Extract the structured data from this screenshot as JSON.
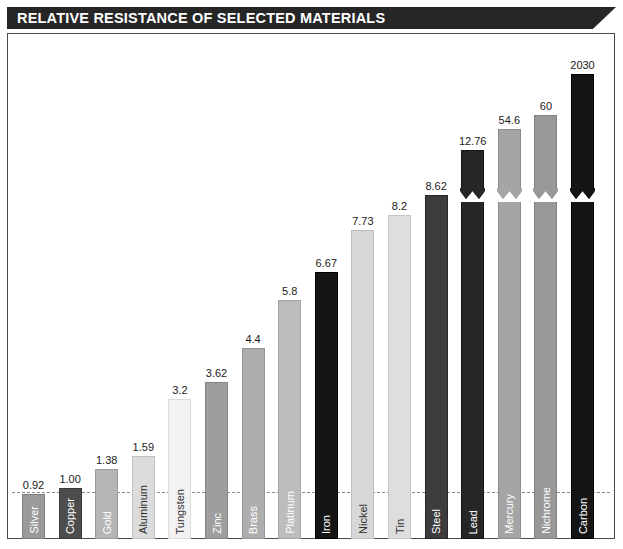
{
  "header": {
    "title": "RELATIVE RESISTANCE OF SELECTED MATERIALS"
  },
  "chart_data": {
    "type": "bar",
    "title": "RELATIVE RESISTANCE OF SELECTED MATERIALS",
    "xlabel": "",
    "ylabel": "",
    "grid": false,
    "legend": "none",
    "reference_line": 1.0,
    "note": "Bars for Lead, Mercury, Nichrome and Carbon are drawn with an axis-break (zig-zag) because their values exceed the linear scale.",
    "categories": [
      "Silver",
      "Copper",
      "Gold",
      "Aluminum",
      "Tungsten",
      "Zinc",
      "Brass",
      "Platinum",
      "Iron",
      "Nickel",
      "Tin",
      "Steel",
      "Lead",
      "Mercury",
      "Nichrome",
      "Carbon"
    ],
    "values": [
      0.92,
      1.0,
      1.38,
      1.59,
      3.2,
      3.62,
      4.4,
      5.8,
      6.67,
      7.73,
      8.2,
      8.62,
      12.76,
      54.6,
      60,
      2030
    ],
    "value_labels": [
      "0.92",
      "1.00",
      "1.38",
      "1.59",
      "3.2",
      "3.62",
      "4.4",
      "5.8",
      "6.67",
      "7.73",
      "8.2",
      "8.62",
      "12.76",
      "54.6",
      "60",
      "2030"
    ],
    "bars": [
      {
        "name": "Silver",
        "value": 0.92,
        "label": "0.92",
        "fill": "#9a9a9a",
        "border": "#7d7d7d",
        "text": "#ffffff",
        "px_top": 495,
        "broken": false
      },
      {
        "name": "Copper",
        "value": 1.0,
        "label": "1.00",
        "fill": "#4d4d4d",
        "border": "#3a3a3a",
        "text": "#ffffff",
        "px_top": 489,
        "broken": false
      },
      {
        "name": "Gold",
        "value": 1.38,
        "label": "1.38",
        "fill": "#b5b5b5",
        "border": "#9b9b9b",
        "text": "#ffffff",
        "px_top": 470,
        "broken": false
      },
      {
        "name": "Aluminum",
        "value": 1.59,
        "label": "1.59",
        "fill": "#dcdcdc",
        "border": "#c0c0c0",
        "text": "#303030",
        "px_top": 457,
        "broken": false
      },
      {
        "name": "Tungsten",
        "value": 3.2,
        "label": "3.2",
        "fill": "#f2f2f2",
        "border": "#dcdcdc",
        "text": "#303030",
        "px_top": 400,
        "broken": false
      },
      {
        "name": "Zinc",
        "value": 3.62,
        "label": "3.62",
        "fill": "#9e9e9e",
        "border": "#858585",
        "text": "#ffffff",
        "px_top": 383,
        "broken": false
      },
      {
        "name": "Brass",
        "value": 4.4,
        "label": "4.4",
        "fill": "#aeaeae",
        "border": "#949494",
        "text": "#ffffff",
        "px_top": 349,
        "broken": false
      },
      {
        "name": "Platinum",
        "value": 5.8,
        "label": "5.8",
        "fill": "#bdbdbd",
        "border": "#a3a3a3",
        "text": "#ffffff",
        "px_top": 301,
        "broken": false
      },
      {
        "name": "Iron",
        "value": 6.67,
        "label": "6.67",
        "fill": "#151515",
        "border": "#000000",
        "text": "#ffffff",
        "px_top": 273,
        "broken": false
      },
      {
        "name": "Nickel",
        "value": 7.73,
        "label": "7.73",
        "fill": "#d7d7d7",
        "border": "#bdbdbd",
        "text": "#303030",
        "px_top": 231,
        "broken": false
      },
      {
        "name": "Tin",
        "value": 8.2,
        "label": "8.2",
        "fill": "#dedede",
        "border": "#c4c4c4",
        "text": "#303030",
        "px_top": 216,
        "broken": false
      },
      {
        "name": "Steel",
        "value": 8.62,
        "label": "8.62",
        "fill": "#3c3c3c",
        "border": "#272727",
        "text": "#ffffff",
        "px_top": 196,
        "broken": false
      },
      {
        "name": "Lead",
        "value": 12.76,
        "label": "12.76",
        "fill": "#262626",
        "border": "#141414",
        "text": "#ffffff",
        "px_top": 151,
        "broken": true
      },
      {
        "name": "Mercury",
        "value": 54.6,
        "label": "54.6",
        "fill": "#a5a5a5",
        "border": "#8c8c8c",
        "text": "#ffffff",
        "px_top": 130,
        "broken": true
      },
      {
        "name": "Nichrome",
        "value": 60,
        "label": "60",
        "fill": "#989898",
        "border": "#808080",
        "text": "#ffffff",
        "px_top": 116,
        "broken": true
      },
      {
        "name": "Carbon",
        "value": 2030,
        "label": "2030",
        "fill": "#141414",
        "border": "#000000",
        "text": "#ffffff",
        "px_top": 75,
        "broken": true
      }
    ]
  },
  "layout": {
    "bar_width_px": 23,
    "first_bar_left_px": 14,
    "bar_pitch_px": 36.6,
    "baseline_px": 540,
    "unity_line_px": 491,
    "break_mark_px": 196
  }
}
